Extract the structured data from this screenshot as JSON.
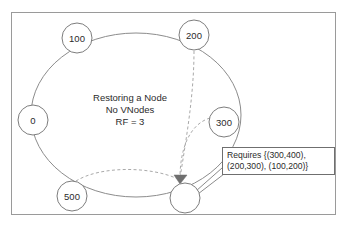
{
  "diagram": {
    "title_caption": {
      "line1": "Restoring a Node",
      "line2": "No VNodes",
      "line3": "RF = 3"
    },
    "ring": {
      "center_x": 136,
      "center_y": 115,
      "radius_x": 105,
      "radius_y": 82,
      "stroke_color": "#8c8c8c"
    },
    "nodes": [
      {
        "label": "100",
        "x": 77,
        "y": 38,
        "r": 15,
        "filled": false
      },
      {
        "label": "200",
        "x": 194,
        "y": 35,
        "r": 15,
        "filled": false
      },
      {
        "label": "300",
        "x": 224,
        "y": 122,
        "r": 15,
        "filled": false
      },
      {
        "label": "0",
        "x": 33,
        "y": 120,
        "r": 15,
        "filled": false
      },
      {
        "label": "500",
        "x": 72,
        "y": 196,
        "r": 15,
        "filled": false
      },
      {
        "label": "",
        "x": 185,
        "y": 198,
        "r": 15,
        "filled": false
      }
    ],
    "flows": [
      {
        "name": "stream-from-200",
        "from": "200",
        "to": "restored-node"
      },
      {
        "name": "stream-from-300",
        "from": "300",
        "to": "restored-node"
      },
      {
        "name": "stream-from-500",
        "from": "500",
        "to": "restored-node"
      }
    ],
    "arrow_target": {
      "x": 180,
      "y": 181
    },
    "callout": {
      "line1": "Requires {(300,400),",
      "line2": "(200,300), (100,200)}",
      "x": 222,
      "y": 147,
      "width": 113,
      "height": 28
    },
    "colors": {
      "ring_stroke": "#8c8c8c",
      "node_stroke": "#7d7d7d",
      "dashed_flow": "#a9a9a9",
      "arrowhead": "#6f6f6f",
      "text": "#2b2b2b",
      "frame": "#9a9a9a",
      "background": "#ffffff"
    }
  }
}
